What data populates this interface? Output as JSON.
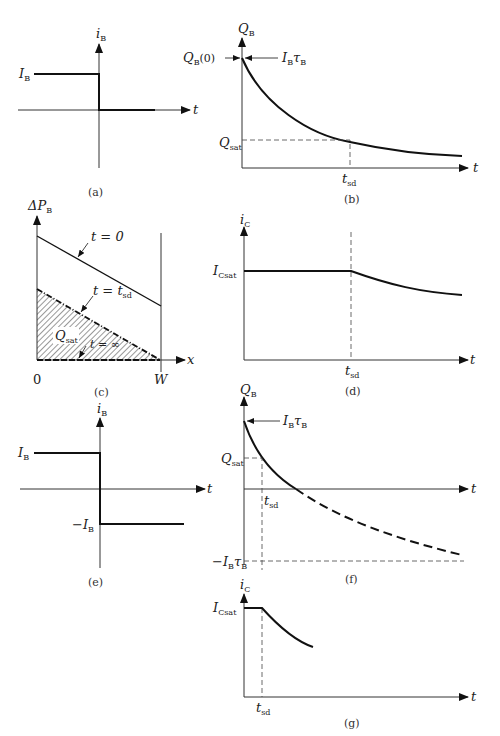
{
  "figure": {
    "panels": {
      "a": {
        "caption": "(a)",
        "y_label": "i",
        "y_sub": "B",
        "x_label": "t",
        "level_label": "I",
        "level_sub": "B"
      },
      "b": {
        "caption": "(b)",
        "y_label": "Q",
        "y_sub": "B",
        "x_label": "t",
        "q0_label": "Q",
        "q0_sub": "B",
        "q0_suffix": "(0)",
        "ibtau_label": "I",
        "ibtau_sub1": "B",
        "ibtau_tau": "τ",
        "ibtau_sub2": "B",
        "qsat_label": "Q",
        "qsat_sub": "sat",
        "tsd_label": "t",
        "tsd_sub": "sd"
      },
      "c": {
        "caption": "(c)",
        "y_label": "ΔP",
        "y_sub": "B",
        "x_label": "x",
        "origin_label": "0",
        "w_label": "W",
        "t0_label": "t = 0",
        "tsd_label": "t = t",
        "tsd_sub": "sd",
        "tinf_label": "t = ∞",
        "qsat_label": "Q",
        "qsat_sub": "sat"
      },
      "d": {
        "caption": "(d)",
        "y_label": "i",
        "y_sub": "C",
        "x_label": "t",
        "icsat_label": "I",
        "icsat_sub": "Csat",
        "tsd_label": "t",
        "tsd_sub": "sd"
      },
      "e": {
        "caption": "(e)",
        "y_label": "i",
        "y_sub": "B",
        "x_label": "t",
        "pos_label": "I",
        "pos_sub": "B",
        "neg_label": "−I",
        "neg_sub": "B"
      },
      "f": {
        "caption": "(f)",
        "y_label": "Q",
        "y_sub": "B",
        "x_label": "t",
        "ibtau_label": "I",
        "ibtau_sub1": "B",
        "ibtau_tau": "τ",
        "ibtau_sub2": "B",
        "qsat_label": "Q",
        "qsat_sub": "sat",
        "tsd_label": "t",
        "tsd_sub": "sd",
        "neg_label": "−I",
        "neg_sub1": "B",
        "neg_tau": "τ",
        "neg_sub2": "B"
      },
      "g": {
        "caption": "(g)",
        "y_label": "i",
        "y_sub": "C",
        "x_label": "t",
        "icsat_label": "I",
        "icsat_sub": "Csat",
        "tsd_label": "t",
        "tsd_sub": "sd"
      }
    }
  }
}
